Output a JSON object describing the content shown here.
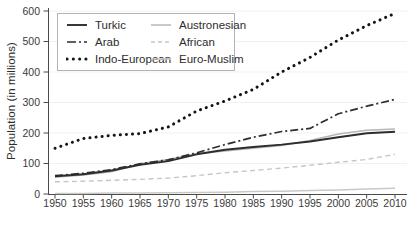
{
  "chart_data": {
    "type": "line",
    "title": "",
    "xlabel": "",
    "ylabel": "Population (in millions)",
    "x": [
      1950,
      1955,
      1960,
      1965,
      1970,
      1975,
      1980,
      1985,
      1990,
      1995,
      2000,
      2005,
      2010
    ],
    "x_tick_labels": [
      "1950",
      "1955",
      "1960",
      "1965",
      "1970",
      "1975",
      "1980",
      "1985",
      "1990",
      "1995",
      "2000",
      "2005",
      "2010"
    ],
    "ylim": [
      0,
      600
    ],
    "yticks": [
      0,
      100,
      200,
      300,
      400,
      500,
      600
    ],
    "grid": "very faint horizontal lines at each 100",
    "legend_position": "upper-left boxed, two columns",
    "series": [
      {
        "name": "Turkic",
        "style": "solid",
        "color": "#2d2d2d",
        "width": 1.9,
        "values": [
          58,
          65,
          77,
          96,
          108,
          130,
          145,
          154,
          162,
          172,
          186,
          199,
          204
        ]
      },
      {
        "name": "Arab",
        "style": "dash-dot",
        "color": "#2d2d2d",
        "width": 1.7,
        "values": [
          60,
          68,
          80,
          99,
          112,
          135,
          162,
          186,
          205,
          215,
          263,
          288,
          310
        ]
      },
      {
        "name": "Indo-European",
        "style": "bold-dotted",
        "color": "#141414",
        "width": 3.0,
        "values": [
          150,
          182,
          192,
          198,
          220,
          272,
          305,
          343,
          400,
          448,
          505,
          552,
          592
        ]
      },
      {
        "name": "Austronesian",
        "style": "solid",
        "color": "#b7b7b7",
        "width": 1.5,
        "values": [
          55,
          62,
          73,
          99,
          113,
          132,
          141,
          150,
          159,
          175,
          197,
          209,
          213
        ]
      },
      {
        "name": "African",
        "style": "dashed",
        "color": "#c6c6c6",
        "width": 1.4,
        "values": [
          40,
          42,
          45,
          48,
          52,
          60,
          70,
          77,
          85,
          94,
          104,
          113,
          130
        ]
      },
      {
        "name": "Euro-Muslim",
        "style": "solid",
        "color": "#c9c9c4",
        "width": 1.5,
        "values": [
          2,
          2,
          3,
          3,
          4,
          5,
          6,
          8,
          9,
          11,
          13,
          16,
          19
        ]
      }
    ],
    "legend_column_order": [
      0,
      3,
      1,
      4,
      2,
      5
    ],
    "axis_color": "#4a4a4a",
    "tick_label_color": "#3a3a3a",
    "grid_color": "rgba(0,0,0,0.06)"
  }
}
